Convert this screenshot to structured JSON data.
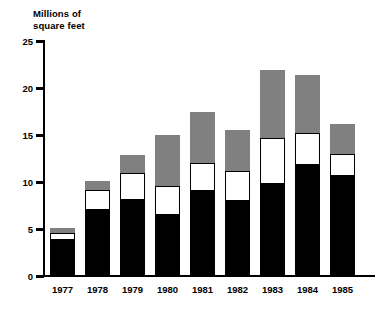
{
  "chart_data": {
    "type": "bar",
    "title": "Millions of\nsquare feet",
    "xlabel": "",
    "ylabel": "Millions of square feet",
    "ylim": [
      0,
      25
    ],
    "yticks": [
      0,
      5,
      10,
      15,
      20,
      25
    ],
    "ytick_labels": [
      "0",
      "5",
      "10",
      "15",
      "20",
      "25"
    ],
    "grid": false,
    "legend": null,
    "stacked": true,
    "categories": [
      "1977",
      "1978",
      "1979",
      "1980",
      "1981",
      "1982",
      "1983",
      "1984",
      "1985"
    ],
    "series": [
      {
        "name": "bottom-segment",
        "color": "#000000",
        "values": [
          3.8,
          7.0,
          8.1,
          6.5,
          9.0,
          8.0,
          9.8,
          11.8,
          10.6
        ]
      },
      {
        "name": "middle-segment",
        "color": "#ffffff",
        "values": [
          0.8,
          2.1,
          2.9,
          3.1,
          3.0,
          3.2,
          4.9,
          3.4,
          2.4
        ]
      },
      {
        "name": "top-segment",
        "color": "#808080",
        "values": [
          0.5,
          1.0,
          1.9,
          5.4,
          5.5,
          4.3,
          7.2,
          6.2,
          3.2
        ]
      }
    ],
    "totals": [
      5.1,
      10.1,
      12.9,
      15.0,
      17.5,
      15.5,
      21.9,
      21.4,
      16.2
    ],
    "cumulative_tops": {
      "bottom": [
        3.8,
        7.0,
        8.1,
        6.5,
        9.0,
        8.0,
        9.8,
        11.8,
        10.6
      ],
      "middle": [
        4.6,
        9.1,
        11.0,
        9.6,
        12.0,
        11.2,
        14.7,
        15.2,
        13.0
      ],
      "top": [
        5.1,
        10.1,
        12.9,
        15.0,
        17.5,
        15.5,
        21.9,
        21.4,
        16.2
      ]
    },
    "colors": {
      "black_segment": "#000000",
      "white_segment": "#ffffff",
      "gray_segment": "#808080",
      "axis": "#000000",
      "background": "#ffffff"
    }
  }
}
